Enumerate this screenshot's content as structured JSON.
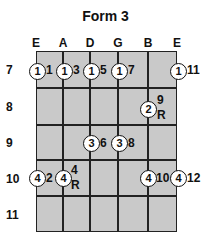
{
  "title": "Form 3",
  "strings": [
    "E",
    "A",
    "D",
    "G",
    "B",
    "E"
  ],
  "frets": [
    "7",
    "8",
    "9",
    "10",
    "11"
  ],
  "notes": [
    {
      "string": 0,
      "fret": 0,
      "finger": "1",
      "degree": "1"
    },
    {
      "string": 1,
      "fret": 0,
      "finger": "1",
      "degree": "3"
    },
    {
      "string": 2,
      "fret": 0,
      "finger": "1",
      "degree": "5"
    },
    {
      "string": 3,
      "fret": 0,
      "finger": "1",
      "degree": "7"
    },
    {
      "string": 5,
      "fret": 0,
      "finger": "1",
      "degree": "11"
    },
    {
      "string": 4,
      "fret": 1,
      "finger": "2",
      "degree": "9",
      "root": "R"
    },
    {
      "string": 2,
      "fret": 2,
      "finger": "3",
      "degree": "6"
    },
    {
      "string": 3,
      "fret": 2,
      "finger": "3",
      "degree": "8"
    },
    {
      "string": 0,
      "fret": 3,
      "finger": "4",
      "degree": "2"
    },
    {
      "string": 1,
      "fret": 3,
      "finger": "4",
      "degree": "4",
      "root": "R"
    },
    {
      "string": 4,
      "fret": 3,
      "finger": "4",
      "degree": "10"
    },
    {
      "string": 5,
      "fret": 3,
      "finger": "4",
      "degree": "12"
    }
  ]
}
